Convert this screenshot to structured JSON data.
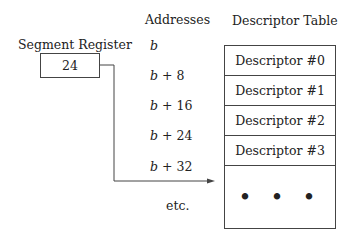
{
  "headers": {
    "addresses": "Addresses",
    "descriptor_table": "Descriptor Table"
  },
  "segment_register": {
    "label": "Segment Register",
    "value": "24"
  },
  "addresses": [
    {
      "base": "b",
      "offset": ""
    },
    {
      "base": "b",
      "offset": " + 8"
    },
    {
      "base": "b",
      "offset": " + 16"
    },
    {
      "base": "b",
      "offset": " + 24"
    },
    {
      "base": "b",
      "offset": " + 32"
    },
    {
      "base": "",
      "offset": "etc."
    }
  ],
  "descriptors": [
    "Descriptor #0",
    "Descriptor #1",
    "Descriptor #2",
    "Descriptor #3",
    "• • •"
  ],
  "arrow": {
    "from": "segment_register",
    "to": "Descriptor #3",
    "points_at_address": "b + 24"
  },
  "colors": {
    "line": "#444444",
    "text": "#222222",
    "background": "#ffffff"
  }
}
